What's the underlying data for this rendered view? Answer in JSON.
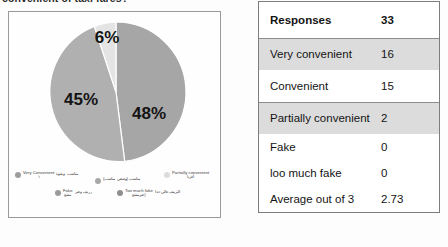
{
  "caption": {
    "text": "convenient of taxi fares?"
  },
  "chart_data": {
    "type": "pie",
    "title": "",
    "categories": [
      "Very Convenient",
      "Convenient",
      "Partially convenient"
    ],
    "values": [
      48,
      45,
      6
    ],
    "value_labels": [
      "48%",
      "45%",
      "6%"
    ],
    "colors": [
      "#a6a6a6",
      "#b0b0b0",
      "#e2e2e2"
    ],
    "legend_position": "bottom",
    "legend": [
      {
        "label_en": "Very Convenient",
        "label_ar": "مناسب وبقوة",
        "label_ar_2": "١",
        "color": "#9e9e9e"
      },
      {
        "label_en": "",
        "label_ar": "مناسب (وضعي مناسب)",
        "label_ar_2": "",
        "color": "#a8a8a8"
      },
      {
        "label_en": "Partially convenient",
        "label_ar": "مناسب",
        "label_ar_2": "أقربا",
        "color": "#dcdcdc"
      },
      {
        "label_en": "Fake",
        "label_ar": "زريف وغير",
        "label_ar_2": "مقنع",
        "color": "#9a9a9a"
      },
      {
        "label_en": "Too much fake",
        "label_ar": "التزييف عالي جدا",
        "label_ar_2": "(غيرمقنع",
        "color": "#8f8f8f"
      }
    ]
  },
  "table": {
    "rows": [
      {
        "label": "Responses",
        "value": "33",
        "header": true,
        "shaded": false
      },
      {
        "label": "Very convenient",
        "value": "16",
        "header": false,
        "shaded": true
      },
      {
        "label": "Convenient",
        "value": "15",
        "header": false,
        "shaded": false
      },
      {
        "label": "Partially convenient",
        "value": "2",
        "header": false,
        "shaded": true
      },
      {
        "label": "Fake",
        "value": "0",
        "header": false,
        "shaded": false
      },
      {
        "label": "loo much fake",
        "value": "0",
        "header": false,
        "shaded": false
      },
      {
        "label": "Average out of 3",
        "value": "2.73",
        "header": false,
        "shaded": false
      }
    ]
  }
}
